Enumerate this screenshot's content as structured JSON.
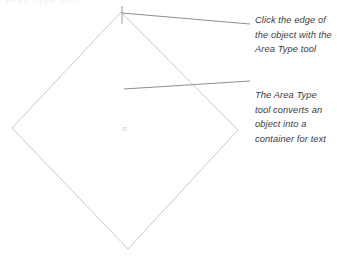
{
  "figure": {
    "clipped_header_text": "Area Type tool",
    "shape": {
      "name": "diamond-object",
      "stroke_color": "#c9c9c9",
      "vertices": {
        "top": [
          121,
          12
        ],
        "left": [
          12,
          128
        ],
        "bottom": [
          128,
          249
        ],
        "right": [
          238,
          130
        ]
      },
      "center_mark": [
        125,
        129
      ]
    },
    "cursor_mark": {
      "name": "anchor-tick",
      "color": "#9a9a9a",
      "x": 122,
      "y_top": 6,
      "y_bottom": 24
    },
    "leader_lines": [
      {
        "name": "leader-line-top",
        "color": "#8e8e8e",
        "from": [
          122,
          13
        ],
        "to": [
          250,
          24
        ]
      },
      {
        "name": "leader-line-bottom",
        "color": "#8e8e8e",
        "from": [
          124,
          89
        ],
        "to": [
          250,
          81
        ]
      }
    ]
  },
  "annotations": [
    {
      "id": "click-edge",
      "lines": [
        "Click the edge of",
        "the object with the",
        "Area Type tool"
      ]
    },
    {
      "id": "area-type",
      "lines": [
        "The Area Type",
        "tool converts an",
        "object into a",
        "container for text"
      ]
    }
  ]
}
